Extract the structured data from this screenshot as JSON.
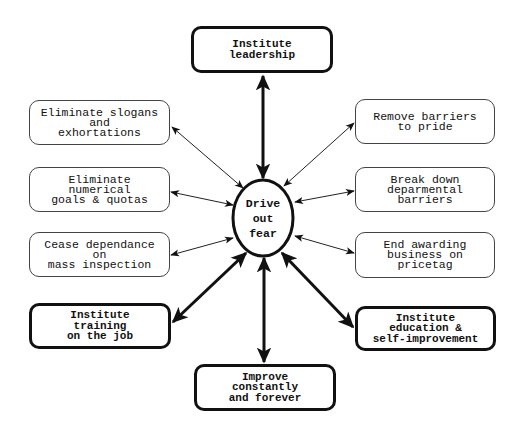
{
  "diagram": {
    "center": {
      "lines": [
        "Drive",
        "out",
        "fear"
      ]
    },
    "nodes": {
      "top": {
        "lines": [
          "Institute",
          "leadership"
        ],
        "style": "bold"
      },
      "left_1": {
        "lines": [
          "Eliminate slogans",
          "and",
          "exhortations"
        ],
        "style": "thin"
      },
      "left_2": {
        "lines": [
          "Eliminate",
          "numerical",
          "goals & quotas"
        ],
        "style": "thin"
      },
      "left_3": {
        "lines": [
          "Cease dependance",
          "on",
          "mass inspection"
        ],
        "style": "thin"
      },
      "left_4": {
        "lines": [
          "Institute",
          "training",
          "on the job"
        ],
        "style": "bold"
      },
      "right_1": {
        "lines": [
          "Remove barriers",
          "to pride"
        ],
        "style": "thin"
      },
      "right_2": {
        "lines": [
          "Break down",
          "deparmental",
          "barriers"
        ],
        "style": "thin"
      },
      "right_3": {
        "lines": [
          "End awarding",
          "business on",
          "pricetag"
        ],
        "style": "thin"
      },
      "right_4": {
        "lines": [
          "Institute",
          "education &",
          "self-improvement"
        ],
        "style": "bold"
      },
      "bottom": {
        "lines": [
          "Improve",
          "constantly",
          "and forever"
        ],
        "style": "bold"
      }
    },
    "colors": {
      "stroke": "#111111",
      "thin_border": "#444444",
      "background": "#ffffff"
    }
  }
}
